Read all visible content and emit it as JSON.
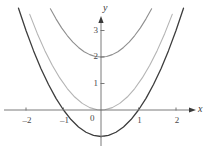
{
  "figure": {
    "background": "#ffffff",
    "axis_color": "#6b6b6b",
    "tick_label_color": "#4a4a4a"
  },
  "axes": {
    "x_label": "x",
    "y_label": "y",
    "x_ticks": [
      {
        "value": -2,
        "label": "–2"
      },
      {
        "value": -1,
        "label": "–1"
      },
      {
        "value": 1,
        "label": "1"
      },
      {
        "value": 2,
        "label": "2"
      }
    ],
    "y_ticks": [
      {
        "value": -1,
        "label": ""
      },
      {
        "value": 1,
        "label": "1"
      },
      {
        "value": 2,
        "label": "2"
      },
      {
        "value": 3,
        "label": "3"
      }
    ],
    "origin_label": "0"
  },
  "chart_data": {
    "type": "line",
    "title": "",
    "subtitle": "",
    "xlabel": "x",
    "ylabel": "y",
    "xlim": [
      -2.55,
      2.45
    ],
    "ylim": [
      -1.45,
      3.55
    ],
    "grid": false,
    "legend": "none",
    "annotations": [],
    "x_ticks": [
      -2,
      -1,
      0,
      1,
      2
    ],
    "y_ticks": [
      -1,
      0,
      1,
      2,
      3
    ],
    "series": [
      {
        "name": "y = x^2 + 2",
        "expression": "x^2 + 2",
        "color": "#8e8e8e",
        "width": 1.1,
        "vertex": [
          0,
          2
        ],
        "x": [
          -1.35,
          -1.2,
          -1.05,
          -0.9,
          -0.75,
          -0.6,
          -0.45,
          -0.3,
          -0.15,
          0,
          0.15,
          0.3,
          0.45,
          0.6,
          0.75,
          0.9,
          1.05,
          1.2,
          1.35
        ],
        "values": [
          3.82,
          3.44,
          3.1,
          2.81,
          2.56,
          2.36,
          2.2,
          2.09,
          2.02,
          2,
          2.02,
          2.09,
          2.2,
          2.36,
          2.56,
          2.81,
          3.1,
          3.44,
          3.82
        ]
      },
      {
        "name": "y = x^2",
        "expression": "x^2",
        "color": "#b4b4b4",
        "width": 1.1,
        "vertex": [
          0,
          0
        ],
        "x": [
          -1.9,
          -1.7,
          -1.5,
          -1.3,
          -1.1,
          -0.9,
          -0.7,
          -0.5,
          -0.3,
          -0.1,
          0,
          0.1,
          0.3,
          0.5,
          0.7,
          0.9,
          1.1,
          1.3,
          1.5,
          1.7,
          1.9
        ],
        "values": [
          3.61,
          2.89,
          2.25,
          1.69,
          1.21,
          0.81,
          0.49,
          0.25,
          0.09,
          0.01,
          0,
          0.01,
          0.09,
          0.25,
          0.49,
          0.81,
          1.21,
          1.69,
          2.25,
          2.89,
          3.61
        ]
      },
      {
        "name": "y = x^2 - 1",
        "expression": "x^2 - 1",
        "color": "#3d3d3d",
        "width": 1.3,
        "vertex": [
          0,
          -1
        ],
        "roots": [
          -1,
          1
        ],
        "x": [
          -2.2,
          -2,
          -1.8,
          -1.6,
          -1.4,
          -1.2,
          -1,
          -0.8,
          -0.6,
          -0.4,
          -0.2,
          0,
          0.2,
          0.4,
          0.6,
          0.8,
          1,
          1.2,
          1.4,
          1.6,
          1.8,
          2,
          2.2
        ],
        "values": [
          3.84,
          3,
          2.24,
          1.56,
          0.96,
          0.44,
          0,
          -0.36,
          -0.64,
          -0.84,
          -0.96,
          -1,
          -0.96,
          -0.84,
          -0.64,
          -0.36,
          0,
          0.44,
          0.96,
          1.56,
          2.24,
          3,
          3.84
        ]
      }
    ]
  }
}
